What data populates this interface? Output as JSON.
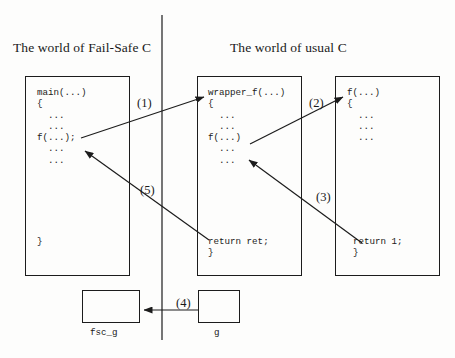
{
  "diagram": {
    "titles": {
      "left": "The world of Fail-Safe C",
      "right": "The world of usual C"
    },
    "divider": {
      "name": "world-divider",
      "x": 162,
      "y1": 15,
      "y2": 340
    },
    "boxes": [
      {
        "id": "main",
        "name": "code-box-main",
        "top_lines": "main(...)\n{\n  ...\n  ...\nf(...);\n  ...\n  ...",
        "bottom_lines": "}"
      },
      {
        "id": "wrapper_f",
        "name": "code-box-wrapper-f",
        "top_lines": "wrapper_f(...)\n{\n  ...\n  ...\nf(...)\n  ...\n  ...",
        "bottom_lines": "return ret;\n}"
      },
      {
        "id": "f",
        "name": "code-box-f",
        "top_lines": "f(...)\n{\n  ...\n  ...\n  ...",
        "bottom_lines": "return 1;\n}"
      }
    ],
    "small_boxes": [
      {
        "id": "fsc_g",
        "name": "data-box-fsc-g",
        "label": "fsc_g"
      },
      {
        "id": "g",
        "name": "data-box-g",
        "label": "g"
      }
    ],
    "arrow_labels": {
      "one": "(1)",
      "two": "(2)",
      "three": "(3)",
      "four": "(4)",
      "five": "(5)"
    },
    "colors": {
      "stroke": "#1c1c1c",
      "text": "#1a1a1a",
      "background": "#fdfdfc"
    }
  }
}
